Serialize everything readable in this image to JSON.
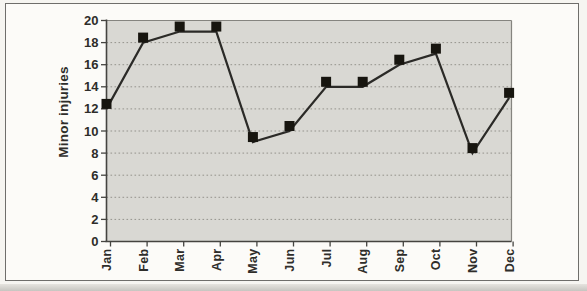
{
  "figure": {
    "background": "#fcfbf8",
    "frame_border_color": "#6f6e6b"
  },
  "chart_data": {
    "type": "line",
    "title": "",
    "categories": [
      "Jan",
      "Feb",
      "Mar",
      "Apr",
      "May",
      "Jun",
      "Jul",
      "Aug",
      "Sep",
      "Oct",
      "Nov",
      "Dec"
    ],
    "values": [
      12,
      18,
      19,
      19,
      9,
      10,
      14,
      14,
      16,
      17,
      8,
      13
    ],
    "series": [
      {
        "name": "Minor injuries",
        "values": [
          12,
          18,
          19,
          19,
          9,
          10,
          14,
          14,
          16,
          17,
          8,
          13
        ]
      }
    ],
    "xlabel": "",
    "ylabel": "Minor injuries",
    "ylim": [
      0,
      20
    ],
    "yticks": [
      0,
      2,
      4,
      6,
      8,
      10,
      12,
      14,
      16,
      18,
      20
    ],
    "grid": "horizontal-dotted",
    "legend": "none",
    "marker": "square",
    "colors": {
      "plot_background": "#d9d8d3",
      "gridline": "#94938c",
      "plot_border": "#85847f",
      "axis": "#454440",
      "line": "#2b2a27",
      "marker": "#17150f",
      "text": "#2e2d2a"
    }
  }
}
